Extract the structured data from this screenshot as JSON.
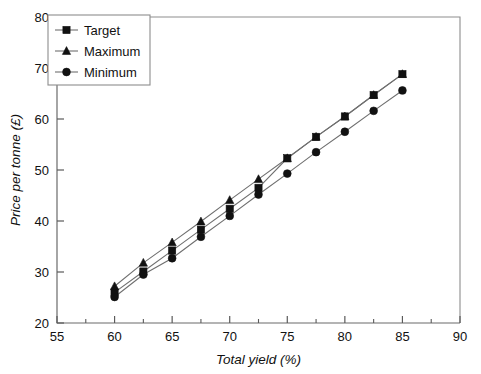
{
  "chart_data": {
    "type": "line",
    "title": "",
    "xlabel": "Total yield (%)",
    "ylabel": "Price per tonne (£)",
    "xlim": [
      55,
      90
    ],
    "ylim": [
      20,
      80
    ],
    "x_major_ticks": [
      55,
      60,
      65,
      70,
      75,
      80,
      85,
      90
    ],
    "x_minor_ticks": [
      57.5,
      62.5,
      67.5,
      72.5,
      77.5,
      82.5,
      87.5
    ],
    "y_major_ticks": [
      20,
      30,
      40,
      50,
      60,
      70,
      80
    ],
    "x_tick_labels": [
      "55",
      "60",
      "65",
      "70",
      "75",
      "80",
      "85",
      "90"
    ],
    "y_tick_labels": [
      "20",
      "30",
      "40",
      "50",
      "60",
      "70",
      "80"
    ],
    "grid": false,
    "legend_position": "top-left",
    "x": [
      60,
      62.5,
      65,
      67.5,
      70,
      72.5,
      75,
      77.5,
      80,
      82.5,
      85
    ],
    "series": [
      {
        "name": "Target",
        "marker": "square",
        "values": [
          26.0,
          30.1,
          34.2,
          38.3,
          42.4,
          46.5,
          52.3,
          56.5,
          60.5,
          64.7,
          68.8
        ]
      },
      {
        "name": "Maximum",
        "marker": "triangle",
        "values": [
          27.2,
          31.8,
          35.8,
          39.9,
          44.1,
          48.2,
          52.3,
          56.5,
          60.5,
          64.7,
          68.8
        ]
      },
      {
        "name": "Minimum",
        "marker": "circle",
        "values": [
          25.1,
          29.5,
          32.7,
          36.9,
          41.0,
          45.2,
          49.3,
          53.5,
          57.5,
          61.6,
          65.6
        ]
      }
    ]
  },
  "legend": {
    "entries": [
      {
        "label": "Target",
        "marker": "square"
      },
      {
        "label": "Maximum",
        "marker": "triangle"
      },
      {
        "label": "Minimum",
        "marker": "circle"
      }
    ]
  },
  "colors": {
    "marker": "#111111",
    "line": "#6f6f6f",
    "axis": "#5a5a5a",
    "frame": "#8d8d8d",
    "background": "#ffffff"
  },
  "caption_fragment": "Total"
}
